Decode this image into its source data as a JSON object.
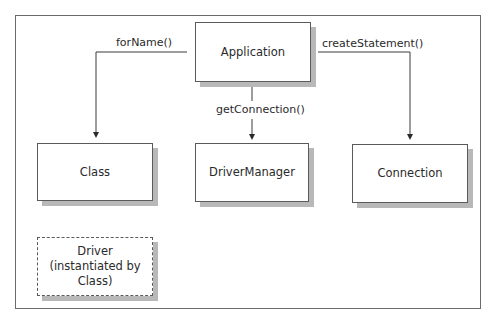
{
  "diagram": {
    "nodes": {
      "application": "Application",
      "class": "Class",
      "driver_manager": "DriverManager",
      "connection": "Connection",
      "driver_line1": "Driver",
      "driver_line2": "(instantiated by",
      "driver_line3": "Class)"
    },
    "edges": {
      "for_name": "forName()",
      "get_connection": "getConnection()",
      "create_statement": "createStatement()"
    },
    "edge_list": [
      {
        "from": "Application",
        "to": "Class",
        "label": "forName()"
      },
      {
        "from": "Application",
        "to": "DriverManager",
        "label": "getConnection()"
      },
      {
        "from": "Application",
        "to": "Connection",
        "label": "createStatement()"
      }
    ],
    "colors": {
      "line": "#3a3a3a",
      "shadow": "#b8b8b8",
      "box_fill": "#ffffff"
    }
  }
}
